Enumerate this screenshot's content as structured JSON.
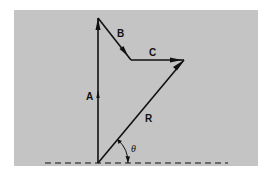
{
  "diagram": {
    "type": "vector-addition",
    "background_color": "#c4c4c4",
    "line_color": "#111111",
    "vectors": [
      {
        "label": "A",
        "from": [
          98,
          163
        ],
        "to": [
          98,
          18
        ],
        "label_pos": [
          88,
          98
        ]
      },
      {
        "label": "B",
        "from": [
          98,
          18
        ],
        "to": [
          131,
          60
        ],
        "label_pos": [
          118,
          36
        ]
      },
      {
        "label": "C",
        "from": [
          131,
          60
        ],
        "to": [
          184,
          60
        ],
        "label_pos": [
          152,
          55
        ]
      },
      {
        "label": "R",
        "from": [
          98,
          163
        ],
        "to": [
          184,
          60
        ],
        "label_pos": [
          145,
          120
        ]
      }
    ],
    "angle": {
      "label": "θ",
      "vertex": [
        98,
        163
      ],
      "label_pos": [
        132,
        151
      ]
    },
    "baseline": {
      "style": "dashed",
      "from": [
        45,
        163
      ],
      "to": [
        228,
        163
      ]
    }
  }
}
